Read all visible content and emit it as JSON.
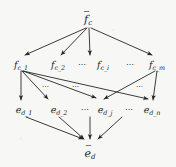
{
  "figure": {
    "type": "hierarchical-graph",
    "background_color": "#f7f7f6",
    "ink_color": "#262626",
    "width": 176,
    "height": 167,
    "levels": [
      {
        "id": "level-root",
        "nodes": [
          {
            "id": "f-tilde-c",
            "base": "f",
            "accent": "~",
            "subscript": "c",
            "x": 88,
            "y": 18
          }
        ]
      },
      {
        "id": "level-f",
        "nodes": [
          {
            "id": "f-c-1",
            "base": "f",
            "accent": "",
            "subscript": "c_1",
            "x": 21,
            "y": 63
          },
          {
            "id": "f-c-2",
            "base": "f",
            "accent": "",
            "subscript": "c_2",
            "x": 58,
            "y": 63
          },
          {
            "id": "f-c-i",
            "base": "f",
            "accent": "",
            "subscript": "c_i",
            "x": 103,
            "y": 63
          },
          {
            "id": "f-c-m",
            "base": "f",
            "accent": "",
            "subscript": "c_m",
            "x": 157,
            "y": 63
          }
        ],
        "ellipses": [
          {
            "id": "f-ellipsis-left",
            "text": "⋯",
            "x": 82,
            "y": 64
          },
          {
            "id": "f-ellipsis-right",
            "text": "⋯",
            "x": 130,
            "y": 64
          }
        ]
      },
      {
        "id": "level-e",
        "nodes": [
          {
            "id": "e-d-1",
            "base": "e",
            "accent": "",
            "subscript": "d_1",
            "x": 24,
            "y": 108
          },
          {
            "id": "e-d-2",
            "base": "e",
            "accent": "",
            "subscript": "d_2",
            "x": 59,
            "y": 108
          },
          {
            "id": "e-d-j",
            "base": "e",
            "accent": "",
            "subscript": "d_j",
            "x": 105,
            "y": 108
          },
          {
            "id": "e-d-n",
            "base": "e",
            "accent": "",
            "subscript": "d_n",
            "x": 152,
            "y": 108
          }
        ],
        "ellipses": [
          {
            "id": "e-ellipsis-left",
            "text": "⋯",
            "x": 85,
            "y": 109
          },
          {
            "id": "e-ellipsis-right",
            "text": "⋯",
            "x": 129,
            "y": 109
          }
        ]
      },
      {
        "id": "level-leaf",
        "nodes": [
          {
            "id": "e-tilde-d",
            "base": "e",
            "accent": "~",
            "subscript": "d",
            "x": 90,
            "y": 152
          }
        ]
      }
    ],
    "band_ellipses": [
      {
        "id": "band-ellipsis-1",
        "text": "⋯",
        "x": 46,
        "y": 87
      },
      {
        "id": "band-ellipsis-2",
        "text": "⋯",
        "x": 76,
        "y": 87
      },
      {
        "id": "band-ellipsis-3",
        "text": "⋯",
        "x": 140,
        "y": 87
      }
    ],
    "edges": [
      {
        "id": "edge-root-to-f-c-1",
        "from": "f-tilde-c",
        "to": "f-c-1",
        "x1": 86,
        "y1": 28,
        "x2": 25,
        "y2": 55
      },
      {
        "id": "edge-root-to-f-c-2",
        "from": "f-tilde-c",
        "to": "f-c-2",
        "x1": 87,
        "y1": 28,
        "x2": 61,
        "y2": 55
      },
      {
        "id": "edge-root-to-f-c-i",
        "from": "f-tilde-c",
        "to": "f-c-i",
        "x1": 89,
        "y1": 28,
        "x2": 90,
        "y2": 55
      },
      {
        "id": "edge-root-to-f-c-m",
        "from": "f-tilde-c",
        "to": "f-c-m",
        "x1": 91,
        "y1": 28,
        "x2": 152,
        "y2": 55
      },
      {
        "id": "edge-f-c-1-to-e-d-1",
        "from": "f-c-1",
        "to": "e-d-1",
        "x1": 21,
        "y1": 71,
        "x2": 21,
        "y2": 100
      },
      {
        "id": "edge-f-c-1-to-e-d-2",
        "from": "f-c-1",
        "to": "e-d-2",
        "x1": 22,
        "y1": 71,
        "x2": 48,
        "y2": 99
      },
      {
        "id": "edge-f-c-1-to-e-d-j",
        "from": "f-c-1",
        "to": "e-d-j",
        "x1": 23,
        "y1": 71,
        "x2": 96,
        "y2": 98
      },
      {
        "id": "edge-f-c-1-to-e-d-n",
        "from": "f-c-1",
        "to": "e-d-n",
        "x1": 23,
        "y1": 71,
        "x2": 148,
        "y2": 99
      },
      {
        "id": "edge-f-c-m-to-e-d-j",
        "from": "f-c-m",
        "to": "e-d-j",
        "x1": 155,
        "y1": 71,
        "x2": 104,
        "y2": 99
      },
      {
        "id": "edge-f-c-m-to-e-d-n",
        "from": "f-c-m",
        "to": "e-d-n",
        "x1": 157,
        "y1": 71,
        "x2": 153,
        "y2": 100
      },
      {
        "id": "edge-e-d-1-to-leaf",
        "from": "e-d-1",
        "to": "e-tilde-d",
        "x1": 26,
        "y1": 117,
        "x2": 83,
        "y2": 139
      },
      {
        "id": "edge-e-d-2-to-leaf",
        "from": "e-d-2",
        "to": "e-tilde-d",
        "x1": 59,
        "y1": 117,
        "x2": 84,
        "y2": 139
      },
      {
        "id": "edge-e-d-j-to-leaf",
        "from": "e-d-j",
        "to": "e-tilde-d",
        "x1": 90,
        "y1": 117,
        "x2": 90,
        "y2": 139
      },
      {
        "id": "edge-e-d-n-to-leaf",
        "from": "e-d-n",
        "to": "e-tilde-d",
        "x1": 122,
        "y1": 117,
        "x2": 98,
        "y2": 139
      }
    ]
  }
}
